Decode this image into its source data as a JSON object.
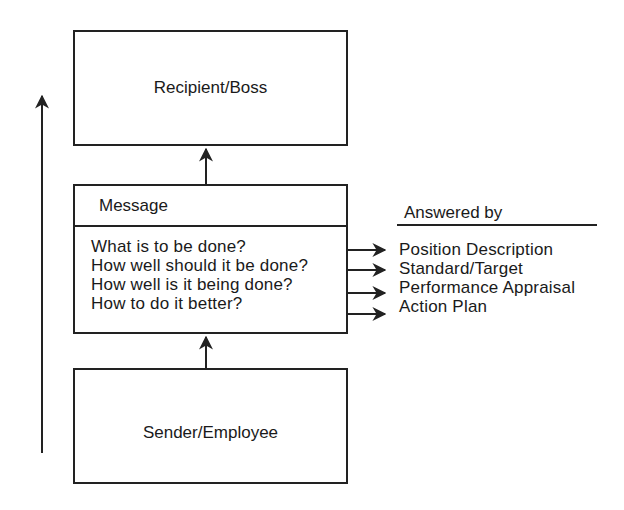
{
  "diagram": {
    "recipient_box": {
      "label": "Recipient/Boss"
    },
    "sender_box": {
      "label": "Sender/Employee"
    },
    "message_box": {
      "title": "Message",
      "questions": [
        "What is to be done?",
        "How well should it be done?",
        "How well is it being done?",
        "How to do it better?"
      ]
    },
    "answered_by": {
      "title": "Answered by",
      "answers": [
        "Position Description",
        "Standard/Target",
        "Performance Appraisal",
        "Action Plan"
      ]
    },
    "colors": {
      "line": "#222222",
      "background": "#ffffff",
      "text": "#1a1a1a"
    }
  }
}
